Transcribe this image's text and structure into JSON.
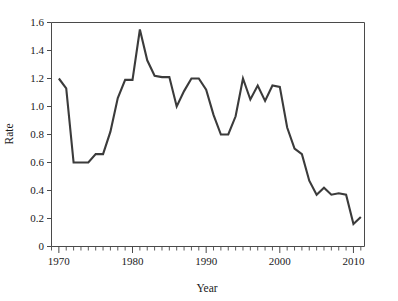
{
  "chart_data": {
    "type": "line",
    "title": "",
    "xlabel": "Year",
    "ylabel": "Rate",
    "xlim": [
      1969,
      2011.5
    ],
    "ylim": [
      0,
      1.6
    ],
    "grid": false,
    "legend": null,
    "line_color": "#3b3b3b",
    "axis_color": "#4a4a4a",
    "x_major_ticks": [
      1970,
      1980,
      1990,
      2000,
      2010
    ],
    "x_major_tick_labels": [
      "1970",
      "1980",
      "1990",
      "2000",
      "2010"
    ],
    "x_minor_tick_interval": 1,
    "y_ticks": [
      0,
      0.2,
      0.4,
      0.6,
      0.8,
      1.0,
      1.2,
      1.4,
      1.6
    ],
    "y_tick_labels": [
      "0",
      "0.2",
      "0.4",
      "0.6",
      "0.8",
      "1.0",
      "1.2",
      "1.4",
      "1.6"
    ],
    "x": [
      1970,
      1971,
      1972,
      1973,
      1974,
      1975,
      1976,
      1977,
      1978,
      1979,
      1980,
      1981,
      1982,
      1983,
      1984,
      1985,
      1986,
      1987,
      1988,
      1989,
      1990,
      1991,
      1992,
      1993,
      1994,
      1995,
      1996,
      1997,
      1998,
      1999,
      2000,
      2001,
      2002,
      2003,
      2004,
      2005,
      2006,
      2007,
      2008,
      2009,
      2010,
      2011
    ],
    "values": [
      1.2,
      1.13,
      0.6,
      0.6,
      0.6,
      0.66,
      0.66,
      0.82,
      1.06,
      1.19,
      1.19,
      1.55,
      1.33,
      1.22,
      1.21,
      1.21,
      1.0,
      1.11,
      1.2,
      1.2,
      1.12,
      0.94,
      0.8,
      0.8,
      0.93,
      1.2,
      1.05,
      1.15,
      1.04,
      1.15,
      1.14,
      0.85,
      0.7,
      0.66,
      0.47,
      0.37,
      0.42,
      0.37,
      0.38,
      0.37,
      0.16,
      0.21
    ],
    "series": [
      {
        "name": "Rate",
        "values": [
          1.2,
          1.13,
          0.6,
          0.6,
          0.6,
          0.66,
          0.66,
          0.82,
          1.06,
          1.19,
          1.19,
          1.55,
          1.33,
          1.22,
          1.21,
          1.21,
          1.0,
          1.11,
          1.2,
          1.2,
          1.12,
          0.94,
          0.8,
          0.8,
          0.93,
          1.2,
          1.05,
          1.15,
          1.04,
          1.15,
          1.14,
          0.85,
          0.7,
          0.66,
          0.47,
          0.37,
          0.42,
          0.37,
          0.38,
          0.37,
          0.16,
          0.21
        ]
      }
    ],
    "annotations": []
  }
}
